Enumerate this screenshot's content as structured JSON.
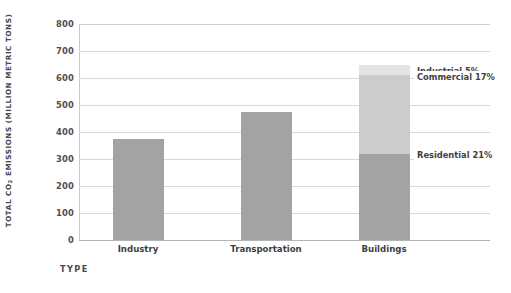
{
  "chart_data": {
    "type": "bar",
    "stacked": true,
    "title": "",
    "xlabel": "TYPE",
    "ylabel": "TOTAL CO2 EMISSIONS (MILLION METRIC TONS)",
    "ylabel_prefix": "TOTAL CO",
    "ylabel_sub": "2",
    "ylabel_suffix": " EMISSIONS (MILLION METRIC TONS)",
    "categories": [
      "Industry",
      "Transportation",
      "Buildings"
    ],
    "ylim": [
      0,
      800
    ],
    "yticks": [
      800,
      700,
      600,
      500,
      400,
      300,
      200,
      100,
      0
    ],
    "ytick_labels": [
      "800",
      "700",
      "600",
      "500",
      "400",
      "300",
      "200",
      "100",
      "0"
    ],
    "grid": true,
    "legend": "none",
    "series": [
      {
        "name": "Residential",
        "color": "#a3a3a3",
        "values": [
          373,
          475,
          320
        ]
      },
      {
        "name": "Commercial",
        "color": "#cccccc",
        "values": [
          0,
          0,
          290
        ]
      },
      {
        "name": "Industrial",
        "color": "#e4e4e4",
        "values": [
          0,
          0,
          40
        ]
      }
    ],
    "totals": [
      373,
      475,
      650
    ],
    "annotations": [
      {
        "label": "Industrial 5%",
        "value": 5,
        "segment": "Industrial"
      },
      {
        "label": "Commercial 17%",
        "value": 17,
        "segment": "Commercial"
      },
      {
        "label": "Residential 21%",
        "value": 21,
        "segment": "Residential"
      }
    ],
    "colors": {
      "residential": "#a3a3a3",
      "commercial": "#cccccc",
      "industrial": "#e4e4e4",
      "grid": "#d8d8d8",
      "axis": "#b4b4b4",
      "text": "#3f3f3f",
      "background": "#ffffff"
    }
  }
}
